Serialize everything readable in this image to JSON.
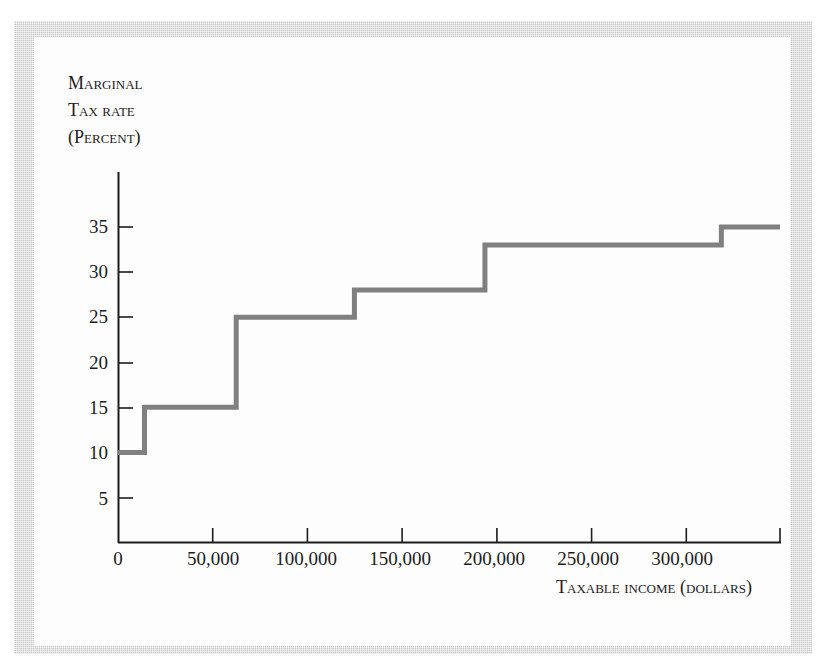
{
  "figure": {
    "background_color": "#ffffff",
    "panel_color": "#fdfdfd",
    "border_color": "#c9c9c9",
    "axis_color": "#1c1c1c",
    "line_color": "#808080"
  },
  "chart_data": {
    "type": "line",
    "subtype": "step",
    "title": "",
    "xlabel_lines": [
      "Taxable income (dollars)"
    ],
    "ylabel_lines": [
      "Marginal",
      "tax rate",
      "(percent)"
    ],
    "xlabel": "Taxable income (dollars)",
    "ylabel": "Marginal tax rate (percent)",
    "grid": false,
    "legend": "none",
    "xlim": [
      0,
      350000
    ],
    "ylim": [
      0,
      37.5
    ],
    "xticks": [
      0,
      50000,
      100000,
      150000,
      200000,
      250000,
      300000,
      350000
    ],
    "xtick_labels": [
      "0",
      "50,000",
      "100,000",
      "150,000",
      "200,000",
      "250,000",
      "300,000",
      ""
    ],
    "yticks": [
      5,
      10,
      15,
      20,
      25,
      30,
      35
    ],
    "ytick_labels": [
      "5",
      "10",
      "15",
      "20",
      "25",
      "30",
      "35"
    ],
    "step_edges": [
      0,
      14000,
      62500,
      125000,
      194000,
      319000,
      350000
    ],
    "step_values": [
      10,
      15,
      25,
      28,
      33,
      35
    ],
    "brackets": [
      {
        "from": 0,
        "to": 14000,
        "rate": 10
      },
      {
        "from": 14000,
        "to": 62500,
        "rate": 15
      },
      {
        "from": 62500,
        "to": 125000,
        "rate": 25
      },
      {
        "from": 125000,
        "to": 194000,
        "rate": 28
      },
      {
        "from": 194000,
        "to": 319000,
        "rate": 33
      },
      {
        "from": 319000,
        "to": 350000,
        "rate": 35
      }
    ]
  }
}
